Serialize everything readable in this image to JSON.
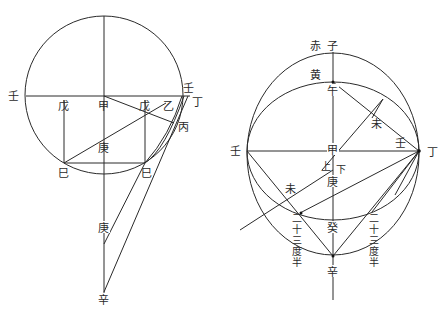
{
  "left_diagram": {
    "labels": {
      "ren_left": "壬",
      "ren_right": "壬",
      "wu_left": "戊",
      "jia": "甲",
      "wu_right": "戊",
      "yi": "乙",
      "ding": "丁",
      "bing": "丙",
      "geng_upper": "庚",
      "si_left": "巳",
      "si_right": "巳",
      "geng_lower": "庚",
      "xin": "辛"
    }
  },
  "right_diagram": {
    "labels": {
      "chi": "赤",
      "zi": "子",
      "huang": "黄",
      "wu_noon": "午",
      "wei_upper": "未",
      "ren_left": "壬",
      "jia": "甲",
      "ren_right": "壬",
      "ding": "丁",
      "shang": "上",
      "xia": "下",
      "geng": "庚",
      "wei_lower": "未",
      "gui": "癸",
      "xin": "辛",
      "degrees_left": [
        "二",
        "十",
        "三",
        "度",
        "半"
      ],
      "degrees_right": [
        "二",
        "十",
        "三",
        "度",
        "半"
      ]
    }
  }
}
